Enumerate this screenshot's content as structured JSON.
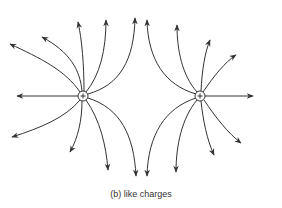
{
  "figure": {
    "caption": "(b) like charges",
    "charges": [
      {
        "id": "left",
        "sign": "+",
        "x": 83,
        "y": 96
      },
      {
        "id": "right",
        "sign": "+",
        "x": 200,
        "y": 96
      }
    ],
    "colors": {
      "line": "#333333",
      "background": "#ffffff"
    }
  }
}
